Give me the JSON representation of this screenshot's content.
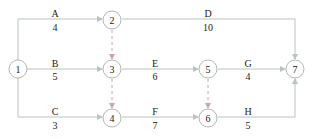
{
  "diagram": {
    "type": "activity-on-arrow network",
    "nodes": [
      {
        "id": "1",
        "label": "1",
        "x": 18,
        "y": 69
      },
      {
        "id": "2",
        "label": "2",
        "x": 112,
        "y": 20
      },
      {
        "id": "3",
        "label": "3",
        "x": 112,
        "y": 69
      },
      {
        "id": "4",
        "label": "4",
        "x": 112,
        "y": 118
      },
      {
        "id": "5",
        "label": "5",
        "x": 208,
        "y": 69
      },
      {
        "id": "6",
        "label": "6",
        "x": 208,
        "y": 118
      },
      {
        "id": "7",
        "label": "7",
        "x": 295,
        "y": 69
      }
    ],
    "activities": [
      {
        "name": "A",
        "duration": "4",
        "from": "1",
        "to": "2"
      },
      {
        "name": "B",
        "duration": "5",
        "from": "1",
        "to": "3"
      },
      {
        "name": "C",
        "duration": "3",
        "from": "1",
        "to": "4"
      },
      {
        "name": "D",
        "duration": "10",
        "from": "2",
        "to": "7"
      },
      {
        "name": "E",
        "duration": "6",
        "from": "3",
        "to": "5"
      },
      {
        "name": "F",
        "duration": "7",
        "from": "4",
        "to": "6"
      },
      {
        "name": "G",
        "duration": "4",
        "from": "5",
        "to": "7"
      },
      {
        "name": "H",
        "duration": "5",
        "from": "6",
        "to": "7"
      }
    ],
    "dummies": [
      {
        "from": "2",
        "to": "3"
      },
      {
        "from": "3",
        "to": "4"
      },
      {
        "from": "5",
        "to": "6"
      }
    ],
    "colors": {
      "edge": "#b9c4bd",
      "dummy": "#c9a8a8",
      "node": "#b5b5b5",
      "text": "#222222"
    }
  }
}
